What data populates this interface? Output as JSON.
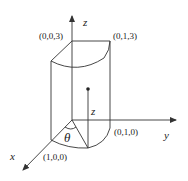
{
  "diagram": {
    "type": "3d-cylindrical-wedge",
    "axes": {
      "x_label": "x",
      "y_label": "y",
      "z_label": "z"
    },
    "points": {
      "top_origin": "(0,0,3)",
      "top_y": "(0,1,3)",
      "bottom_y": "(0,1,0)",
      "bottom_x": "(1,0,0)"
    },
    "annotations": {
      "angle": "θ",
      "height": "z"
    },
    "colors": {
      "stroke": "#333333",
      "background": "#ffffff"
    }
  }
}
